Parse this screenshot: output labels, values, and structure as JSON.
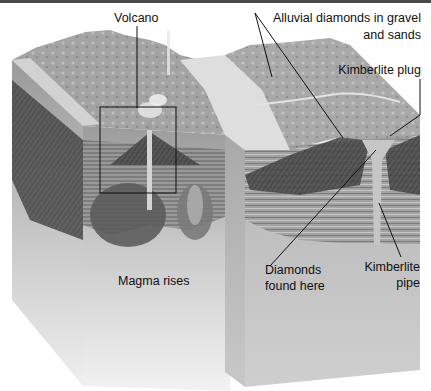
{
  "figure": {
    "colors": {
      "top_band": "#4a4a4a",
      "label_text": "#111111",
      "leader_line": "#111111",
      "sky_bg": "#ffffff"
    }
  },
  "labels": {
    "volcano": "Volcano",
    "alluvial_line1": "Alluvial diamonds in gravel",
    "alluvial_line2": "and sands",
    "kimberlite_plug": "Kimberlite plug",
    "magma_rises": "Magma rises",
    "diamonds_line1": "Diamonds",
    "diamonds_line2": "found here",
    "pipe_line1": "Kimberlite",
    "pipe_line2": "pipe"
  },
  "panels": [
    {
      "name": "left-block",
      "description": "Active volcano cross-section with rising magma"
    },
    {
      "name": "right-block",
      "description": "Eroded landscape with kimberlite pipe and plug"
    }
  ],
  "highlight_box": {
    "x": 100,
    "y": 107,
    "width": 76,
    "height": 86
  }
}
